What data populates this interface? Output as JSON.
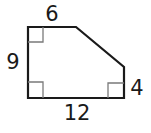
{
  "figure": {
    "type": "pentagon",
    "stroke_color": "#1a1a1a",
    "marker_color": "#7a7a7a",
    "right_angles": [
      "top-left",
      "bottom-left",
      "bottom-right"
    ],
    "labels": {
      "top": "6",
      "left": "9",
      "right": "4",
      "bottom": "12"
    }
  }
}
